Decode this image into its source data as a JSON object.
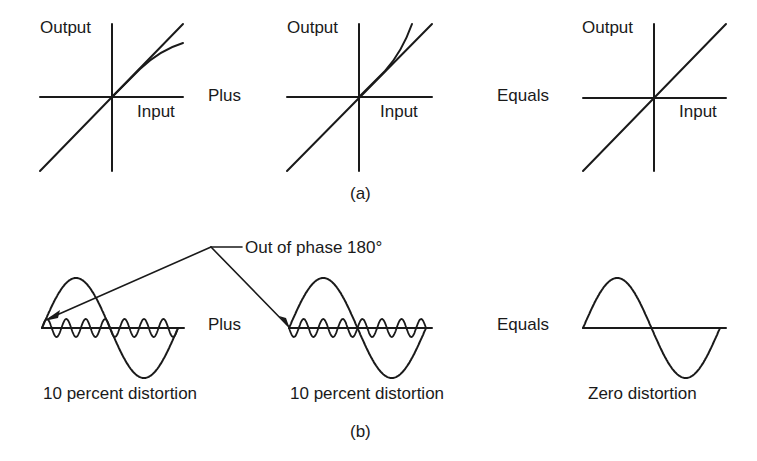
{
  "part_a": {
    "caption": "(a)",
    "graphs": [
      {
        "y_label": "Output",
        "x_label": "Input",
        "description": "linear response plus compressive curve"
      },
      {
        "y_label": "Output",
        "x_label": "Input",
        "description": "linear response plus expansive curve"
      },
      {
        "y_label": "Output",
        "x_label": "Input",
        "description": "pure linear response"
      }
    ],
    "operator_1": "Plus",
    "operator_2": "Equals"
  },
  "part_b": {
    "caption": "(b)",
    "callout": "Out of phase 180°",
    "operator_1": "Plus",
    "operator_2": "Equals",
    "waves": [
      {
        "label": "10 percent distortion",
        "harmonic_cycles": 7,
        "phase": "normal"
      },
      {
        "label": "10 percent distortion",
        "harmonic_cycles": 7,
        "phase": "inverted"
      },
      {
        "label": "Zero distortion",
        "harmonic_cycles": 0,
        "phase": "normal"
      }
    ]
  },
  "colors": {
    "stroke": "#1a1a1a",
    "background": "#ffffff"
  }
}
